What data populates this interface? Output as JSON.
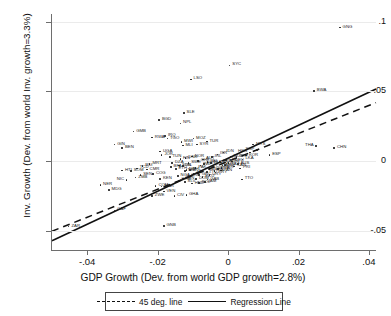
{
  "chart_data": {
    "type": "scatter",
    "title": "",
    "xlabel": "GDP Growth (Dev. from world GDP growth=2.8%)",
    "ylabel": "Inv. Growth (Dev. from world Inv. growth=3.3%)",
    "xlim": [
      -0.05,
      0.042
    ],
    "ylim": [
      -0.062,
      0.104
    ],
    "xticks": [
      -0.04,
      -0.02,
      0,
      0.02,
      0.04
    ],
    "xtick_labels": [
      "-.04",
      "-.02",
      "0",
      ".02",
      ".04"
    ],
    "yticks": [
      -0.05,
      0,
      0.05,
      0.1
    ],
    "ytick_labels": [
      "-.05",
      "0",
      ".05",
      ".1"
    ],
    "grid": "horizontal",
    "legend_position": "below-axis",
    "legend": [
      {
        "label": "45 deg. line",
        "style": "dashed"
      },
      {
        "label": "Regression Line",
        "style": "solid"
      }
    ],
    "lines": [
      {
        "name": "45 deg. line",
        "style": "dashed",
        "slope": 1.0,
        "intercept": 0.0
      },
      {
        "name": "Regression Line",
        "style": "solid",
        "slope": 1.18,
        "intercept": 0.0022
      }
    ],
    "points": [
      {
        "label": "GNG",
        "x": 0.0318,
        "y": 0.0955,
        "side": "right"
      },
      {
        "label": "SYC",
        "x": 0.0005,
        "y": 0.0685,
        "side": "right"
      },
      {
        "label": "LSO",
        "x": -0.0105,
        "y": 0.0585,
        "side": "right"
      },
      {
        "label": "BWA",
        "x": 0.0245,
        "y": 0.05,
        "side": "right"
      },
      {
        "label": "SLE",
        "x": -0.0125,
        "y": 0.0345,
        "side": "right"
      },
      {
        "label": "BGD",
        "x": -0.0195,
        "y": 0.0295,
        "side": "right"
      },
      {
        "label": "NPL",
        "x": -0.0135,
        "y": 0.027,
        "side": "right"
      },
      {
        "label": "GMB",
        "x": -0.0268,
        "y": 0.0212,
        "side": "right"
      },
      {
        "label": "RWA",
        "x": -0.0215,
        "y": 0.0168,
        "side": "right"
      },
      {
        "label": "IRQ",
        "x": -0.0178,
        "y": 0.018,
        "side": "right"
      },
      {
        "label": "TGO",
        "x": -0.0172,
        "y": 0.0162,
        "side": "right"
      },
      {
        "label": "MOZ",
        "x": -0.0098,
        "y": 0.0162,
        "side": "right"
      },
      {
        "label": "MWI",
        "x": -0.0132,
        "y": 0.0138,
        "side": "right"
      },
      {
        "label": "TUR",
        "x": -0.006,
        "y": 0.014,
        "side": "right"
      },
      {
        "label": "SYR",
        "x": -0.0088,
        "y": 0.0118,
        "side": "right"
      },
      {
        "label": "MLI",
        "x": -0.0128,
        "y": 0.0112,
        "side": "right"
      },
      {
        "label": "GIN",
        "x": -0.0322,
        "y": 0.0118,
        "side": "right"
      },
      {
        "label": "BEN",
        "x": -0.03,
        "y": 0.0092,
        "side": "right"
      },
      {
        "label": "UGA",
        "x": -0.0192,
        "y": 0.0068,
        "side": "right"
      },
      {
        "label": "JOR",
        "x": -0.0188,
        "y": 0.0045,
        "side": "right"
      },
      {
        "label": "MYS",
        "x": 0.0072,
        "y": 0.0118,
        "side": "right"
      },
      {
        "label": "IDN",
        "x": -0.0012,
        "y": 0.0062,
        "side": "right"
      },
      {
        "label": "CHN",
        "x": 0.0302,
        "y": 0.0092,
        "side": "right"
      },
      {
        "label": "THA",
        "x": 0.025,
        "y": 0.0108,
        "side": "left"
      },
      {
        "label": "ESP",
        "x": 0.0118,
        "y": 0.0042,
        "side": "right"
      },
      {
        "label": "KOR",
        "x": 0.0052,
        "y": 0.004,
        "side": "right"
      },
      {
        "label": "LKA",
        "x": 0.0042,
        "y": 0.0012,
        "side": "right"
      },
      {
        "label": "CYP",
        "x": 0.0025,
        "y": 0.0028,
        "side": "right"
      },
      {
        "label": "PRI",
        "x": 0.0035,
        "y": -0.0052,
        "side": "right"
      },
      {
        "label": "TTO",
        "x": 0.004,
        "y": -0.013,
        "side": "right"
      },
      {
        "label": "HTI",
        "x": -0.03,
        "y": -0.0068,
        "side": "right"
      },
      {
        "label": "CMR",
        "x": -0.023,
        "y": -0.006,
        "side": "right"
      },
      {
        "label": "KEN",
        "x": -0.0192,
        "y": -0.0128,
        "side": "right"
      },
      {
        "label": "BEN2",
        "x": -0.0128,
        "y": -0.0128,
        "side": "right"
      },
      {
        "label": "GAB",
        "x": -0.0058,
        "y": -0.0132,
        "side": "right"
      },
      {
        "label": "NIC",
        "x": -0.0288,
        "y": -0.0135,
        "side": "left"
      },
      {
        "label": "COM",
        "x": -0.0205,
        "y": -0.0178,
        "side": "right"
      },
      {
        "label": "MAR",
        "x": -0.0188,
        "y": -0.0182,
        "side": "right"
      },
      {
        "label": "VEN",
        "x": -0.0182,
        "y": -0.0218,
        "side": "right"
      },
      {
        "label": "ZWE",
        "x": -0.0215,
        "y": -0.0248,
        "side": "right"
      },
      {
        "label": "CIV",
        "x": -0.0152,
        "y": -0.0248,
        "side": "right"
      },
      {
        "label": "GHA",
        "x": -0.0118,
        "y": -0.0242,
        "side": "right"
      },
      {
        "label": "NER",
        "x": -0.0362,
        "y": -0.0172,
        "side": "right"
      },
      {
        "label": "MDG",
        "x": -0.0338,
        "y": -0.0205,
        "side": "right"
      },
      {
        "label": "CAF",
        "x": -0.0322,
        "y": -0.0352,
        "side": "right"
      },
      {
        "label": "ZAR",
        "x": -0.0452,
        "y": -0.0468,
        "side": "right"
      },
      {
        "label": "GNB",
        "x": -0.0182,
        "y": -0.0462,
        "side": "right"
      },
      {
        "label": "ZMB",
        "x": -0.0262,
        "y": -0.0118,
        "side": "right"
      },
      {
        "label": "SEN",
        "x": -0.0248,
        "y": -0.0098,
        "side": "right"
      },
      {
        "label": "BFA",
        "x": -0.0162,
        "y": -0.0042,
        "side": "right"
      },
      {
        "label": "ETH",
        "x": -0.0148,
        "y": -0.0055,
        "side": "right"
      },
      {
        "label": "SDN",
        "x": -0.0138,
        "y": -0.0032,
        "side": "right"
      },
      {
        "label": "TZA",
        "x": -0.0122,
        "y": -0.0072,
        "side": "right"
      },
      {
        "label": "PHL",
        "x": -0.0108,
        "y": -0.0062,
        "side": "right"
      },
      {
        "label": "PAK",
        "x": -0.0092,
        "y": -0.0048,
        "side": "right"
      },
      {
        "label": "IND",
        "x": -0.0078,
        "y": -0.003,
        "side": "right"
      },
      {
        "label": "EGY",
        "x": -0.0068,
        "y": -0.0022,
        "side": "right"
      },
      {
        "label": "PER",
        "x": -0.0052,
        "y": -0.006,
        "side": "right"
      },
      {
        "label": "COL",
        "x": -0.0042,
        "y": -0.0042,
        "side": "right"
      },
      {
        "label": "MEX",
        "x": -0.0032,
        "y": -0.0018,
        "side": "right"
      },
      {
        "label": "BRA",
        "x": -0.0022,
        "y": -0.0008,
        "side": "right"
      },
      {
        "label": "ARG",
        "x": -0.0015,
        "y": -0.0032,
        "side": "right"
      },
      {
        "label": "CHL",
        "x": -0.0005,
        "y": 0.0008,
        "side": "right"
      },
      {
        "label": "ZAF",
        "x": -0.0098,
        "y": -0.0088,
        "side": "right"
      },
      {
        "label": "GRC",
        "x": -0.0082,
        "y": -0.0098,
        "side": "right"
      },
      {
        "label": "PRT",
        "x": -0.006,
        "y": -0.0078,
        "side": "right"
      },
      {
        "label": "ITA",
        "x": -0.0038,
        "y": -0.0072,
        "side": "right"
      },
      {
        "label": "FRA",
        "x": -0.0028,
        "y": -0.0058,
        "side": "right"
      },
      {
        "label": "GBR",
        "x": -0.0018,
        "y": -0.0048,
        "side": "right"
      },
      {
        "label": "USA",
        "x": -0.0008,
        "y": -0.0028,
        "side": "right"
      },
      {
        "label": "JPN",
        "x": 0.0002,
        "y": -0.0012,
        "side": "right"
      },
      {
        "label": "DEU",
        "x": 0.0012,
        "y": -0.0002,
        "side": "right"
      },
      {
        "label": "CAN",
        "x": 0.0018,
        "y": -0.0038,
        "side": "right"
      },
      {
        "label": "AUS",
        "x": 0.0028,
        "y": -0.002,
        "side": "right"
      },
      {
        "label": "NLD",
        "x": -0.0048,
        "y": -0.0015,
        "side": "right"
      },
      {
        "label": "BEL",
        "x": -0.0058,
        "y": -0.0005,
        "side": "right"
      },
      {
        "label": "AUT",
        "x": -0.007,
        "y": 0.0012,
        "side": "right"
      },
      {
        "label": "CHE",
        "x": -0.0085,
        "y": 0.0002,
        "side": "right"
      },
      {
        "label": "SWE",
        "x": -0.0112,
        "y": -0.0012,
        "side": "right"
      },
      {
        "label": "DNK",
        "x": -0.012,
        "y": 0.0022,
        "side": "right"
      },
      {
        "label": "NOR",
        "x": -0.0102,
        "y": 0.0032,
        "side": "right"
      },
      {
        "label": "FIN",
        "x": -0.0135,
        "y": 0.0015,
        "side": "right"
      },
      {
        "label": "IRL",
        "x": -0.0045,
        "y": 0.0028,
        "side": "right"
      },
      {
        "label": "ISR",
        "x": -0.003,
        "y": 0.0048,
        "side": "right"
      },
      {
        "label": "TUN",
        "x": -0.0165,
        "y": 0.0028,
        "side": "right"
      },
      {
        "label": "DZA",
        "x": -0.0158,
        "y": -0.0012,
        "side": "right"
      },
      {
        "label": "NGA",
        "x": -0.0142,
        "y": -0.0105,
        "side": "right"
      },
      {
        "label": "CRI",
        "x": -0.0112,
        "y": -0.0108,
        "side": "right"
      },
      {
        "label": "DOM",
        "x": -0.009,
        "y": -0.0128,
        "side": "right"
      },
      {
        "label": "ECU",
        "x": -0.0072,
        "y": -0.0112,
        "side": "right"
      },
      {
        "label": "URY",
        "x": -0.0052,
        "y": -0.0098,
        "side": "right"
      },
      {
        "label": "PRY",
        "x": -0.0035,
        "y": -0.0082,
        "side": "right"
      },
      {
        "label": "PAN",
        "x": -0.002,
        "y": -0.0068,
        "side": "right"
      },
      {
        "label": "JAM",
        "x": -0.0065,
        "y": -0.0148,
        "side": "right"
      },
      {
        "label": "BOL",
        "x": -0.0082,
        "y": -0.0155,
        "side": "right"
      },
      {
        "label": "HND",
        "x": -0.0102,
        "y": -0.016,
        "side": "right"
      },
      {
        "label": "SLV",
        "x": -0.0122,
        "y": -0.0148,
        "side": "right"
      },
      {
        "label": "GTM",
        "x": -0.014,
        "y": -0.0138,
        "side": "right"
      },
      {
        "label": "NZL",
        "x": -0.0118,
        "y": -0.0062,
        "side": "right"
      },
      {
        "label": "ISL",
        "x": -0.0128,
        "y": -0.0035,
        "side": "right"
      },
      {
        "label": "MUS",
        "x": 0.0008,
        "y": 0.003,
        "side": "right"
      },
      {
        "label": "HKG",
        "x": 0.0062,
        "y": 0.0062,
        "side": "left"
      },
      {
        "label": "SGP",
        "x": 0.0082,
        "y": 0.0078,
        "side": "left"
      },
      {
        "label": "COG",
        "x": -0.0212,
        "y": -0.0092,
        "side": "right"
      },
      {
        "label": "TCD",
        "x": -0.0258,
        "y": -0.0052,
        "side": "right"
      },
      {
        "label": "BDI",
        "x": -0.0242,
        "y": -0.0035,
        "side": "right"
      },
      {
        "label": "MRT",
        "x": -0.0222,
        "y": -0.0022,
        "side": "right"
      },
      {
        "label": "SOM",
        "x": -0.0275,
        "y": -0.0072,
        "side": "right"
      }
    ]
  }
}
